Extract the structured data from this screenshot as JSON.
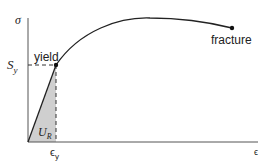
{
  "diagram": {
    "y_axis_label": "σ",
    "x_axis_label": "ϵ",
    "yield_stress_label": "S",
    "yield_stress_sub": "y",
    "yield_strain_label": "ϵ",
    "yield_strain_sub": "y",
    "yield_label": "yield",
    "fracture_label": "fracture",
    "resilience_label": "U",
    "resilience_sub": "R",
    "colors": {
      "line": "#222222",
      "fill": "#cfcfcf"
    }
  }
}
